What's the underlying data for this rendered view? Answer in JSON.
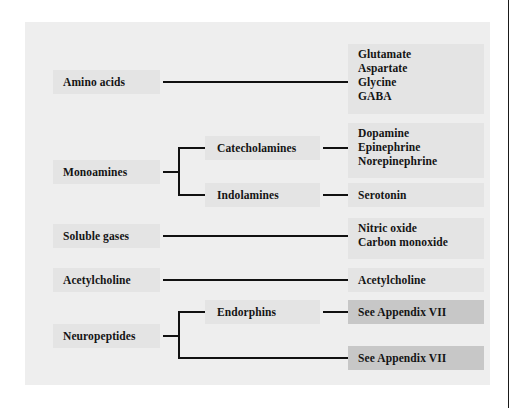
{
  "figure": {
    "type": "hierarchy-tree",
    "title": "",
    "colors": {
      "page_background": "#ffffff",
      "panel_background": "#eeeeee",
      "node_background": "#e4e4e4",
      "appendix_node_background": "#c7c7c7",
      "text": "#141414",
      "connector": "#111111",
      "page_rule": "#1a1a1a"
    },
    "columns": [
      "class",
      "subclass",
      "neurotransmitters"
    ]
  },
  "rows": [
    {
      "class": "Amino acids",
      "subclass": null,
      "items": [
        "Glutamate",
        "Aspartate",
        "Glycine",
        "GABA"
      ]
    },
    {
      "class": "Monoamines",
      "subclasses": [
        {
          "label": "Catecholamines",
          "items": [
            "Dopamine",
            "Epinephrine",
            "Norepinephrine"
          ]
        },
        {
          "label": "Indolamines",
          "items": [
            "Serotonin"
          ]
        }
      ]
    },
    {
      "class": "Soluble gases",
      "subclass": null,
      "items": [
        "Nitric oxide",
        "Carbon monoxide"
      ]
    },
    {
      "class": "Acetylcholine",
      "subclass": null,
      "items": [
        "Acetylcholine"
      ]
    },
    {
      "class": "Neuropeptides",
      "subclasses": [
        {
          "label": "Endorphins",
          "items": [
            "See Appendix VII"
          ]
        },
        {
          "label": null,
          "items": [
            "See Appendix VII"
          ]
        }
      ]
    }
  ],
  "labels": {
    "amino_acids": "Amino acids",
    "glutamate": "Glutamate",
    "aspartate": "Aspartate",
    "glycine": "Glycine",
    "gaba": "GABA",
    "monoamines": "Monoamines",
    "catecholamines": "Catecholamines",
    "dopamine": "Dopamine",
    "epinephrine": "Epinephrine",
    "norepinephrine": "Norepinephrine",
    "indolamines": "Indolamines",
    "serotonin": "Serotonin",
    "soluble_gases": "Soluble gases",
    "nitric_oxide": "Nitric oxide",
    "carbon_monoxide": "Carbon monoxide",
    "acetylcholine_class": "Acetylcholine",
    "acetylcholine_item": "Acetylcholine",
    "neuropeptides": "Neuropeptides",
    "endorphins": "Endorphins",
    "appendix_endorphins": "See Appendix VII",
    "appendix_other": "See Appendix VII"
  }
}
